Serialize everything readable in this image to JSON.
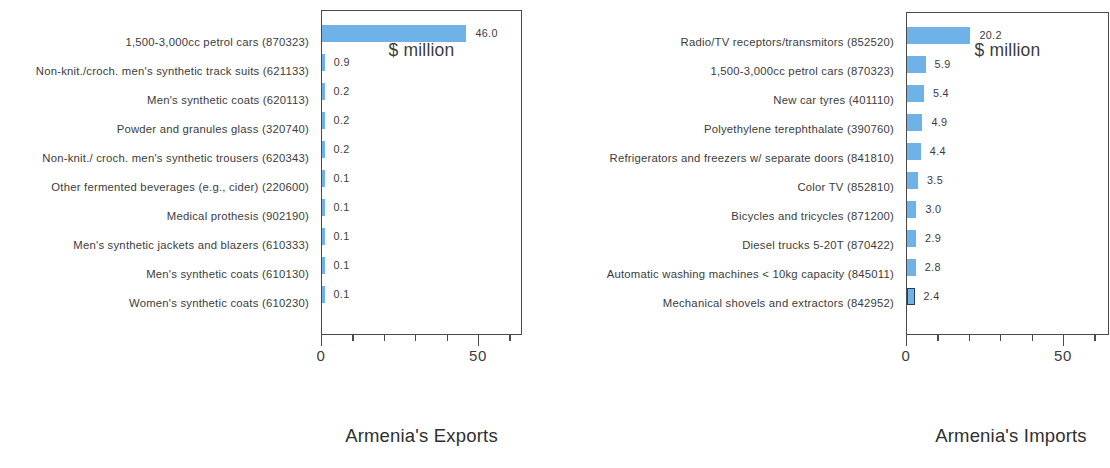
{
  "chart_data": [
    {
      "type": "bar",
      "orientation": "horizontal",
      "title": "Armenia's Exports",
      "xlabel": "$ million",
      "ylabel": "",
      "xlim": [
        0,
        64
      ],
      "axis_ticks": [
        {
          "value": 0,
          "label": "0",
          "major": true
        },
        {
          "value": 10,
          "label": "",
          "major": false
        },
        {
          "value": 20,
          "label": "",
          "major": false
        },
        {
          "value": 30,
          "label": "",
          "major": false
        },
        {
          "value": 40,
          "label": "",
          "major": false
        },
        {
          "value": 50,
          "label": "50",
          "major": true
        },
        {
          "value": 60,
          "label": "",
          "major": false
        }
      ],
      "grid": false,
      "legend": "none",
      "bar_color": "#6fb2e8",
      "categories": [
        "1,500-3,000cc petrol cars (870323)",
        "Non-knit./croch. men's synthetic track suits  (621133)",
        "Men's synthetic coats (620113)",
        "Powder and granules glass (320740)",
        "Non-knit./ croch. men's synthetic trousers (620343)",
        "Other fermented beverages (e.g., cider) (220600)",
        "Medical prothesis (902190)",
        "Men's synthetic jackets and blazers (610333)",
        "Men's synthetic coats (610130)",
        "Women's synthetic coats (610230)"
      ],
      "values": [
        46.0,
        0.9,
        0.2,
        0.2,
        0.2,
        0.1,
        0.1,
        0.1,
        0.1,
        0.1
      ],
      "value_labels": [
        "46.0",
        "0.9",
        "0.2",
        "0.2",
        "0.2",
        "0.1",
        "0.1",
        "0.1",
        "0.1",
        "0.1"
      ],
      "highlighted": []
    },
    {
      "type": "bar",
      "orientation": "horizontal",
      "title": "Armenia's Imports",
      "xlabel": "$ million",
      "ylabel": "",
      "xlim": [
        0,
        64
      ],
      "axis_ticks": [
        {
          "value": 0,
          "label": "0",
          "major": true
        },
        {
          "value": 10,
          "label": "",
          "major": false
        },
        {
          "value": 20,
          "label": "",
          "major": false
        },
        {
          "value": 30,
          "label": "",
          "major": false
        },
        {
          "value": 40,
          "label": "",
          "major": false
        },
        {
          "value": 50,
          "label": "50",
          "major": true
        },
        {
          "value": 60,
          "label": "",
          "major": false
        }
      ],
      "grid": false,
      "legend": "none",
      "bar_color": "#6fb2e8",
      "highlight_border_color": "#2b3d66",
      "categories": [
        "Radio/TV receptors/transmitors (852520)",
        "1,500-3,000cc petrol cars (870323)",
        "New car tyres (401110)",
        "Polyethylene terephthalate (390760)",
        "Refrigerators and freezers w/ separate doors (841810)",
        "Color TV (852810)",
        "Bicycles and tricycles (871200)",
        "Diesel trucks 5-20T (870422)",
        "Automatic washing machines < 10kg capacity (845011)",
        "Mechanical shovels and extractors (842952)"
      ],
      "values": [
        20.2,
        5.9,
        5.4,
        4.9,
        4.4,
        3.5,
        3.0,
        2.9,
        2.8,
        2.4
      ],
      "value_labels": [
        "20.2",
        "5.9",
        "5.4",
        "4.9",
        "4.4",
        "3.5",
        "3.0",
        "2.9",
        "2.8",
        "2.4"
      ],
      "highlighted": [
        9
      ]
    }
  ]
}
